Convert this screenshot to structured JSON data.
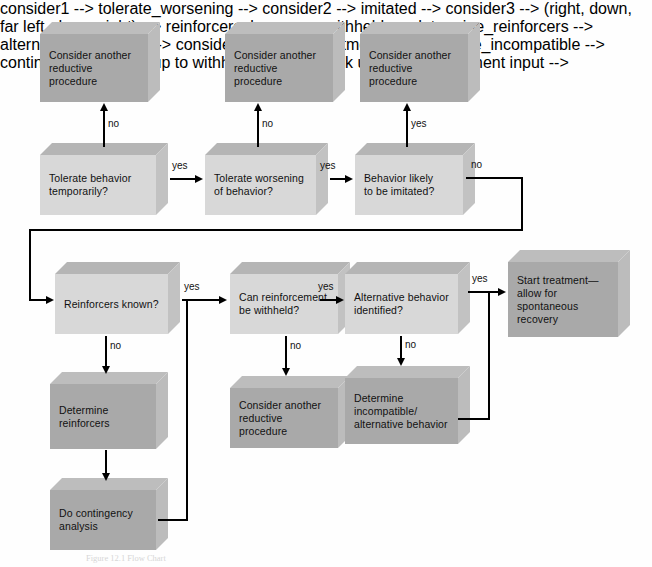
{
  "diagram": {
    "caption": "Figure 12.1  Flow Chart",
    "colors": {
      "action_box_face": "#a9a9a9",
      "decision_box_face": "#d8d8d8",
      "box_top": "#b5b5b5",
      "box_side": "#c2c2c2",
      "connector": "#000000",
      "background": "#ffffff"
    },
    "nodes": [
      {
        "id": "consider1",
        "kind": "action",
        "text": "Consider another\nreductive procedure"
      },
      {
        "id": "consider2",
        "kind": "action",
        "text": "Consider another\nreductive procedure"
      },
      {
        "id": "consider3",
        "kind": "action",
        "text": "Consider another\nreductive procedure"
      },
      {
        "id": "tolerate_behavior",
        "kind": "decision",
        "text": "Tolerate behavior\ntemporarily?"
      },
      {
        "id": "tolerate_worsening",
        "kind": "decision",
        "text": "Tolerate worsening\nof behavior?"
      },
      {
        "id": "imitated",
        "kind": "decision",
        "text": "Behavior likely\nto be imitated?"
      },
      {
        "id": "reinforcers_known",
        "kind": "decision",
        "text": "Reinforcers known?"
      },
      {
        "id": "withheld",
        "kind": "decision",
        "text": "Can reinforcement\nbe withheld?"
      },
      {
        "id": "alternative_identified",
        "kind": "decision",
        "text": "Alternative behavior\nidentified?"
      },
      {
        "id": "start_treatment",
        "kind": "action",
        "text": "Start treatment—\nallow for\nspontaneous\nrecovery"
      },
      {
        "id": "determine_reinforcers",
        "kind": "action",
        "text": "Determine\nreinforcers"
      },
      {
        "id": "consider4",
        "kind": "action",
        "text": "Consider another\nreductive procedure"
      },
      {
        "id": "determine_incompatible",
        "kind": "action",
        "text": "Determine\nincompatible/\nalternative behavior"
      },
      {
        "id": "contingency",
        "kind": "action",
        "text": "Do contingency\nanalysis"
      }
    ],
    "edges": [
      {
        "id": "e1",
        "from": "tolerate_behavior",
        "to": "consider1",
        "label": "no"
      },
      {
        "id": "e2",
        "from": "tolerate_behavior",
        "to": "tolerate_worsening",
        "label": "yes"
      },
      {
        "id": "e3",
        "from": "tolerate_worsening",
        "to": "consider2",
        "label": "no"
      },
      {
        "id": "e4",
        "from": "tolerate_worsening",
        "to": "imitated",
        "label": "yes"
      },
      {
        "id": "e5",
        "from": "imitated",
        "to": "consider3",
        "label": "yes"
      },
      {
        "id": "e6",
        "from": "imitated",
        "to": "reinforcers_known",
        "label": "no"
      },
      {
        "id": "e7",
        "from": "reinforcers_known",
        "to": "withheld",
        "label": "yes"
      },
      {
        "id": "e8",
        "from": "reinforcers_known",
        "to": "determine_reinforcers",
        "label": "no"
      },
      {
        "id": "e9",
        "from": "withheld",
        "to": "alternative_identified",
        "label": "yes"
      },
      {
        "id": "e10",
        "from": "withheld",
        "to": "consider4",
        "label": "no"
      },
      {
        "id": "e11",
        "from": "alternative_identified",
        "to": "start_treatment",
        "label": "yes"
      },
      {
        "id": "e12",
        "from": "alternative_identified",
        "to": "determine_incompatible",
        "label": "no"
      },
      {
        "id": "e13",
        "from": "determine_reinforcers",
        "to": "contingency",
        "label": ""
      },
      {
        "id": "e14",
        "from": "contingency",
        "to": "withheld",
        "label": ""
      },
      {
        "id": "e15",
        "from": "determine_incompatible",
        "to": "start_treatment",
        "label": ""
      }
    ],
    "labels": {
      "yes": "yes",
      "no": "no"
    }
  }
}
